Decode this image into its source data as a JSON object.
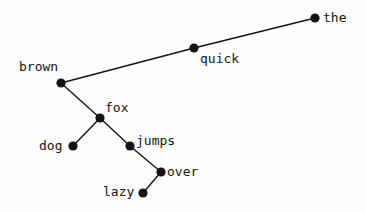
{
  "figure": {
    "type": "dependency-tree-diagram",
    "background_color": "#fdfdfd",
    "ink_color": "#141414",
    "width": 366,
    "height": 212,
    "sentence": "the quick brown fox jumps over the lazy dog"
  },
  "chart_data": {
    "type": "scatter",
    "title": "",
    "xlabel": "",
    "ylabel": "",
    "grid": false,
    "legend": null,
    "nodes": [
      {
        "id": "the",
        "label": "the",
        "x": 315,
        "y": 18,
        "label_x": 323,
        "label_y": 11,
        "label_side": "right"
      },
      {
        "id": "quick",
        "label": "quick",
        "x": 194,
        "y": 48,
        "label_x": 200,
        "label_y": 52,
        "label_side": "right"
      },
      {
        "id": "brown",
        "label": "brown",
        "x": 61,
        "y": 83,
        "label_x": 19,
        "label_y": 60,
        "label_side": "above-left"
      },
      {
        "id": "fox",
        "label": "fox",
        "x": 100,
        "y": 118,
        "label_x": 105,
        "label_y": 101,
        "label_side": "above-right"
      },
      {
        "id": "dog",
        "label": "dog",
        "x": 73,
        "y": 146,
        "label_x": 39,
        "label_y": 139,
        "label_side": "left"
      },
      {
        "id": "jumps",
        "label": "jumps",
        "x": 130,
        "y": 146,
        "label_x": 136,
        "label_y": 134,
        "label_side": "right"
      },
      {
        "id": "over",
        "label": "over",
        "x": 161,
        "y": 172,
        "label_x": 167,
        "label_y": 165,
        "label_side": "right"
      },
      {
        "id": "lazy",
        "label": "lazy",
        "x": 143,
        "y": 193,
        "label_x": 103,
        "label_y": 185,
        "label_side": "left"
      }
    ],
    "edges": [
      {
        "from": "the",
        "to": "quick"
      },
      {
        "from": "quick",
        "to": "brown"
      },
      {
        "from": "brown",
        "to": "fox"
      },
      {
        "from": "fox",
        "to": "dog"
      },
      {
        "from": "fox",
        "to": "jumps"
      },
      {
        "from": "jumps",
        "to": "over"
      },
      {
        "from": "over",
        "to": "lazy"
      }
    ],
    "node_radius": 4.6,
    "xlim": [
      0,
      366
    ],
    "ylim": [
      0,
      212
    ]
  }
}
